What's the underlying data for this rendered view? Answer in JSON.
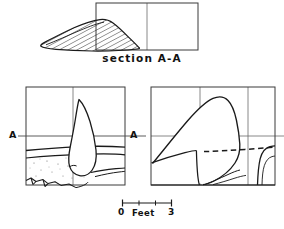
{
  "figure": {
    "ink_color": "#1a1a1a",
    "background_color": "#ffffff",
    "grid_color": "#555555"
  },
  "section_panel": {
    "caption": "section A-A",
    "box": {
      "x": 96,
      "y": 3,
      "width": 102,
      "height": 47
    },
    "grid_vertical_x": [
      147
    ],
    "hatch_spacing": 4,
    "hatch_angle_deg": 62,
    "outline_points": "41,46 48,41 58,34 70,27 82,22 93,19 101,19 108,23 115,30 122,36 128,41 131,45 128,48 118,50 104,51 86,51 68,50 54,49 44,48"
  },
  "plan_panel": {
    "box": {
      "x": 26,
      "y": 87,
      "width": 99,
      "height": 98
    },
    "grid_vertical_x": [
      73
    ],
    "grid_horizontal_y": [
      136
    ],
    "section_line_y": 136,
    "section_line_x_start": 5,
    "section_line_x_end": 146,
    "marker_left": "A",
    "marker_right": "A",
    "feature_outline": "80,100 86,109 90,121 93,134 95,147 95,157 92,166 86,172 79,175 73,174 69,169 68,162 70,151 73,137 76,122 78,110",
    "soil_band_upper": "26,149 44,147 62,146 80,145 98,145 116,146 125,147",
    "soil_band_lower": "26,157 46,155 66,154 86,153 104,153 120,154 125,155",
    "lower_slope": "96,171 106,169 116,168 125,167",
    "rubble_edge": "26,180 34,177 42,180 50,177 58,180 66,178 74,181 82,180",
    "stipple_count": 22
  },
  "profile_panel": {
    "box": {
      "x": 151,
      "y": 87,
      "width": 124,
      "height": 98
    },
    "grid_vertical_x": [
      200,
      248
    ],
    "grid_horizontal_y": [
      136
    ],
    "feature_outline": "152,163 168,141 182,118 196,103 208,96 218,95 228,100 234,112 238,126 240,140 238,152 232,163 224,172 214,180 204,184",
    "dashed_line": "205,151 230,150 252,149 272,147",
    "ledge_line": "151,162 166,157 180,153 192,150 196,150 196,163 197,175 199,184",
    "right_step": "258,184 259,170 261,157 266,150 272,148 275,148",
    "baseline": "151,184 275,184"
  },
  "scale_bar": {
    "zero_label": "0",
    "unit_label": "Feet",
    "max_label": "3",
    "x_start": 122,
    "x_end": 172,
    "y": 203,
    "tick_positions": [
      122,
      139,
      156,
      172
    ]
  }
}
